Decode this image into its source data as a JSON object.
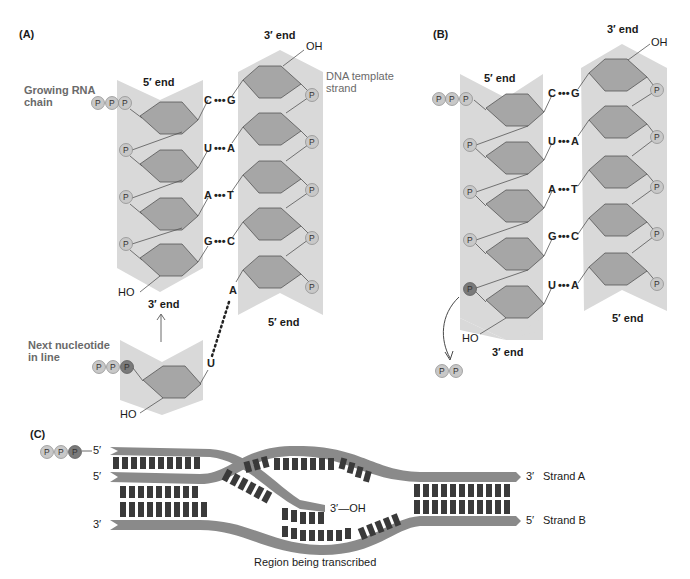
{
  "panels": {
    "A": {
      "label": "(A)",
      "rna_chain_label": "Growing RNA chain",
      "rna_chain_label_line1": "Growing RNA",
      "rna_chain_label_line2": "chain",
      "dna_template_label_line1": "DNA template",
      "dna_template_label_line2": "strand",
      "rna_5_end": "5′ end",
      "rna_3_end": "3′ end",
      "dna_3_end": "3′ end",
      "dna_5_end": "5′ end",
      "oh_top": "OH",
      "ho_bottom": "HO",
      "base_pairs": [
        {
          "rna": "C",
          "dna": "G"
        },
        {
          "rna": "U",
          "dna": "A"
        },
        {
          "rna": "A",
          "dna": "T"
        },
        {
          "rna": "G",
          "dna": "C"
        }
      ],
      "unpaired_dna_base": "A",
      "next_nucleotide_label_line1": "Next nucleotide",
      "next_nucleotide_label_line2": "in line",
      "next_nucleotide_base": "U",
      "next_nucleotide_ho": "HO",
      "phosphate": "P"
    },
    "B": {
      "label": "(B)",
      "rna_5_end": "5′ end",
      "rna_3_end": "3′ end",
      "dna_3_end": "3′ end",
      "dna_5_end": "5′ end",
      "oh_top": "OH",
      "ho_bottom": "HO",
      "base_pairs": [
        {
          "rna": "C",
          "dna": "G"
        },
        {
          "rna": "U",
          "dna": "A"
        },
        {
          "rna": "A",
          "dna": "T"
        },
        {
          "rna": "G",
          "dna": "C"
        },
        {
          "rna": "U",
          "dna": "A"
        }
      ],
      "released_pyrophosphate": [
        "P",
        "P"
      ],
      "phosphate": "P"
    },
    "C": {
      "label": "(C)",
      "rna_5_prime": "5′",
      "rna_3_oh": "3′—OH",
      "strand_a_left": "5′",
      "strand_b_left": "3′",
      "strand_a_right": "3′",
      "strand_b_right": "5′",
      "strand_a_label": "Strand A",
      "strand_b_label": "Strand B",
      "region_label": "Region being transcribed",
      "phosphates": [
        "P",
        "P",
        "P"
      ]
    }
  },
  "colors": {
    "backbone_band": "#d9d9d9",
    "sugar_fill": "#a6a6a6",
    "phosphate_light": "#c8c8c8",
    "phosphate_dark": "#7a7a7a",
    "strand_band": "#8a8a8a",
    "base_rect": "#3a3a3a",
    "label_grey": "#6a6a6a"
  }
}
